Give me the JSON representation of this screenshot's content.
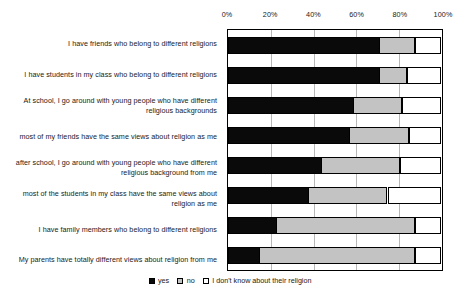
{
  "chart_data": {
    "type": "bar",
    "subtype": "stacked-horizontal-100percent",
    "title": "",
    "xlabel": "",
    "ylabel": "",
    "xlim": [
      0,
      100
    ],
    "grid": true,
    "legend_position": "bottom-center",
    "tick_labels": [
      "0%",
      "20%",
      "40%",
      "60%",
      "80%",
      "100%"
    ],
    "tick_values": [
      0,
      20,
      40,
      60,
      80,
      100
    ],
    "legend": [
      "yes",
      "no",
      "I don't know about their religion"
    ],
    "categories": [
      "I have friends who belong to different religions",
      "I have students in my class who belong to different religions",
      "At school, I go around with young people who have different religious backgrounds",
      "most of my friends have the same views about religion as me",
      "after school, I go around with young people who have different religious background from me",
      "most of the students in my class have the same views about religion as me",
      "I have family members who belong to different religions",
      "My parents have totally different views about religion from me"
    ],
    "series": [
      {
        "name": "yes",
        "color": "#0a0a0a",
        "values": [
          71,
          71,
          59,
          57,
          44,
          38,
          23,
          15
        ]
      },
      {
        "name": "no",
        "color": "#c3c3c3",
        "values": [
          17,
          13,
          23,
          28,
          37,
          37,
          65,
          73
        ]
      },
      {
        "name": "I don't know about their religion",
        "color": "#ffffff",
        "values": [
          12,
          16,
          18,
          15,
          19,
          25,
          12,
          12
        ]
      }
    ]
  }
}
